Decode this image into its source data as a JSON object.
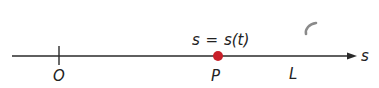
{
  "diagram": {
    "axis": {
      "label": "s",
      "color": "#2a2a2a"
    },
    "origin": {
      "label": "O"
    },
    "point": {
      "label": "P",
      "color": "#c8202a"
    },
    "equation": {
      "lhs": "s",
      "equals": "=",
      "rhs": "s(t)"
    },
    "line_label": "L",
    "colors": {
      "axis": "#2a2a2a",
      "point": "#c8202a",
      "text": "#222222",
      "mark": "#8a8a8a"
    }
  }
}
